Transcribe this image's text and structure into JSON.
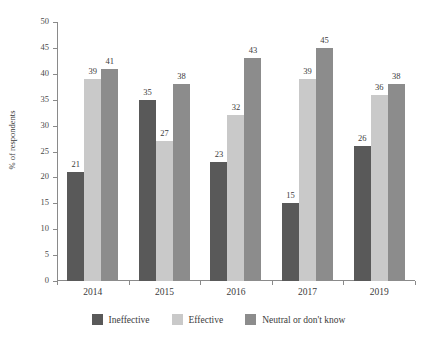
{
  "chart_data": {
    "type": "bar",
    "title": "",
    "xlabel": "",
    "ylabel": "% of respondents",
    "categories": [
      "2014",
      "2015",
      "2016",
      "2017",
      "2019"
    ],
    "series": [
      {
        "name": "Ineffective",
        "color": "#595959",
        "values": [
          21,
          35,
          23,
          15,
          26
        ]
      },
      {
        "name": "Effective",
        "color": "#c9c9c9",
        "values": [
          39,
          27,
          32,
          39,
          36
        ]
      },
      {
        "name": "Neutral or don't know",
        "color": "#8c8c8c",
        "values": [
          41,
          38,
          43,
          45,
          38
        ]
      }
    ],
    "ylim": [
      0,
      50
    ],
    "yticks": [
      50,
      45,
      40,
      35,
      30,
      25,
      20,
      15,
      10,
      5,
      0
    ],
    "grid": false,
    "legend_position": "bottom",
    "data_labels": true,
    "axis_color": "#8a8a8a",
    "background": "#ffffff"
  }
}
